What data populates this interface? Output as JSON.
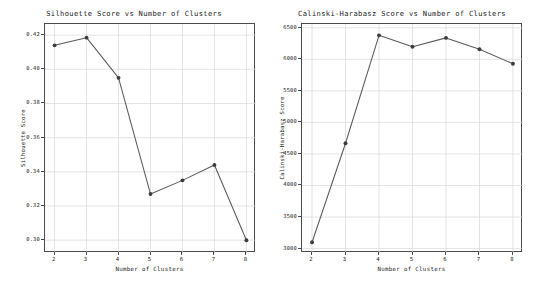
{
  "figure": {
    "background": "#ffffff",
    "line_color": "#5a5a5a",
    "marker_color": "#3c3c3c",
    "grid_color": "#d9d9d9",
    "axis_color": "#4a4a4a"
  },
  "chart_data": [
    {
      "type": "line",
      "title": "Silhouette Score vs Number of Clusters",
      "xlabel": "Number of Clusters",
      "ylabel": "Silhouette Score",
      "x": [
        2,
        3,
        4,
        5,
        6,
        7,
        8
      ],
      "values": [
        0.414,
        0.4185,
        0.395,
        0.327,
        0.335,
        0.344,
        0.3
      ],
      "xticks": [
        "2",
        "3",
        "4",
        "5",
        "6",
        "7",
        "8"
      ],
      "xtick_values": [
        2,
        3,
        4,
        5,
        6,
        7,
        8
      ],
      "yticks": [
        "0.30",
        "0.32",
        "0.34",
        "0.36",
        "0.38",
        "0.40",
        "0.42"
      ],
      "ytick_values": [
        0.3,
        0.32,
        0.34,
        0.36,
        0.38,
        0.4,
        0.42
      ],
      "xlim": [
        1.7,
        8.3
      ],
      "ylim": [
        0.2925,
        0.4265
      ],
      "grid": true,
      "legend": "none",
      "marker": "circle"
    },
    {
      "type": "line",
      "title": "Calinski-Harabasz Score vs Number of Clusters",
      "xlabel": "Number of Clusters",
      "ylabel": "Calinski-Harabasz Score",
      "x": [
        2,
        3,
        4,
        5,
        6,
        7,
        8
      ],
      "values": [
        3100,
        4670,
        6380,
        6200,
        6340,
        6160,
        5930
      ],
      "xticks": [
        "2",
        "3",
        "4",
        "5",
        "6",
        "7",
        "8"
      ],
      "xtick_values": [
        2,
        3,
        4,
        5,
        6,
        7,
        8
      ],
      "yticks": [
        "3000",
        "3500",
        "4000",
        "4500",
        "5000",
        "5500",
        "6000",
        "6500"
      ],
      "ytick_values": [
        3000,
        3500,
        4000,
        4500,
        5000,
        5500,
        6000,
        6500
      ],
      "xlim": [
        1.7,
        8.3
      ],
      "ylim": [
        2930,
        6560
      ],
      "grid": true,
      "legend": "none",
      "marker": "circle"
    }
  ]
}
